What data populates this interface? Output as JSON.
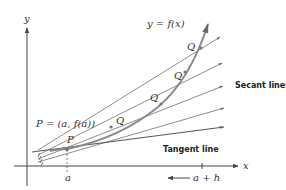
{
  "figure": {
    "axis_x_label": "x",
    "axis_y_label": "y",
    "curve_label": "y = f(x)",
    "point_p_label": "P",
    "point_p_coords_label": "P = (a, f(a))",
    "point_q_label": "Q",
    "secant_lines_label": "Secant lines",
    "tangent_line_label": "Tangent line",
    "tick_a_label": "a",
    "tick_a_plus_h_label": "a + h",
    "colors": {
      "curve": "#8a8a8a",
      "lines": "#6f6f6f",
      "axis": "#444444",
      "text": "#222222"
    }
  }
}
